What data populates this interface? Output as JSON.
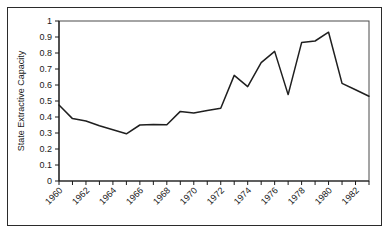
{
  "figure": {
    "background_color": "#ffffff",
    "border_color": "#2b2b2b",
    "line_color": "#1f1f1f"
  },
  "chart_data": {
    "type": "line",
    "title": "",
    "xlabel": "",
    "ylabel": "State Extractive Capacity",
    "xlim": [
      1960,
      1983
    ],
    "ylim": [
      0,
      1
    ],
    "grid": false,
    "legend": false,
    "ytick_labels": [
      "0",
      "0.1",
      "0.2",
      "0.3",
      "0.4",
      "0.5",
      "0.6",
      "0.7",
      "0.8",
      "0.9",
      "1"
    ],
    "ytick_values": [
      0,
      0.1,
      0.2,
      0.3,
      0.4,
      0.5,
      0.6,
      0.7,
      0.8,
      0.9,
      1
    ],
    "xtick_labels": [
      "1960",
      "1962",
      "1964",
      "1966",
      "1968",
      "1970",
      "1972",
      "1974",
      "1976",
      "1978",
      "1980",
      "1982"
    ],
    "xtick_values": [
      1960,
      1962,
      1964,
      1966,
      1968,
      1970,
      1972,
      1974,
      1976,
      1978,
      1980,
      1982
    ],
    "xtick_rotation": 45,
    "series": [
      {
        "name": "State Extractive Capacity",
        "x": [
          1960,
          1961,
          1962,
          1963,
          1964,
          1965,
          1966,
          1967,
          1968,
          1969,
          1970,
          1971,
          1972,
          1973,
          1974,
          1975,
          1976,
          1977,
          1978,
          1979,
          1980,
          1981,
          1982,
          1983
        ],
        "values": [
          0.475,
          0.39,
          0.375,
          0.345,
          0.32,
          0.295,
          0.35,
          0.353,
          0.352,
          0.435,
          0.425,
          0.44,
          0.455,
          0.66,
          0.59,
          0.74,
          0.81,
          0.54,
          0.865,
          0.875,
          0.93,
          0.61,
          0.57,
          0.53
        ]
      }
    ]
  }
}
